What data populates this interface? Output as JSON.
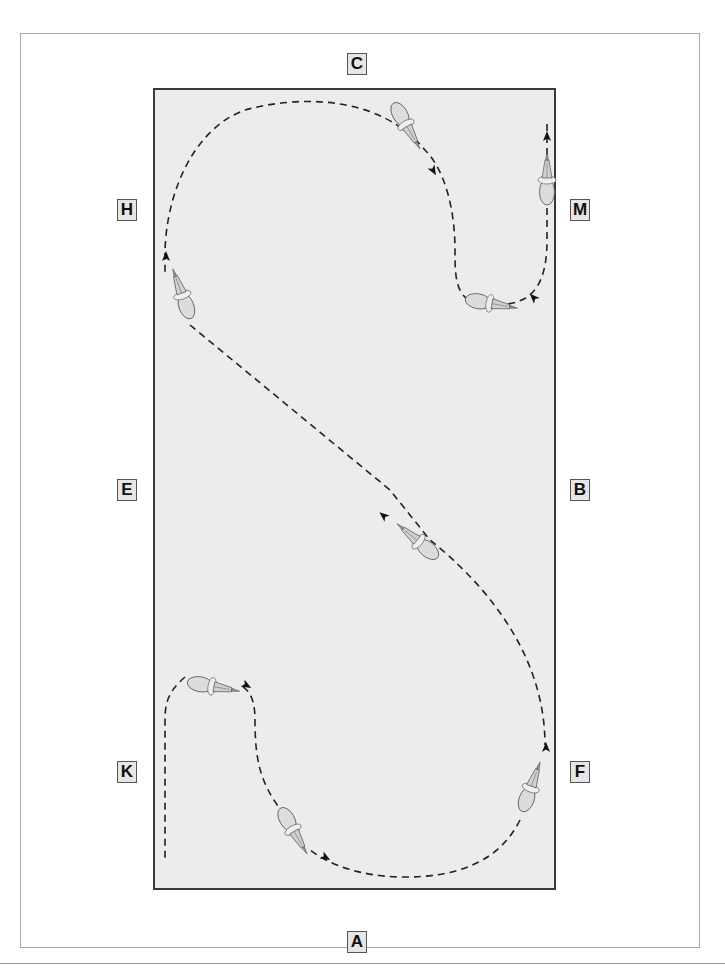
{
  "diagram": {
    "type": "dressage-arena-figure",
    "arena": {
      "fill": "#ececec",
      "border": "#3a3a3a"
    },
    "markers": [
      {
        "id": "C",
        "label": "C",
        "side": "top",
        "x": 347,
        "y": 53
      },
      {
        "id": "H",
        "label": "H",
        "side": "left",
        "x": 117,
        "y": 199
      },
      {
        "id": "M",
        "label": "M",
        "side": "right",
        "x": 570,
        "y": 199
      },
      {
        "id": "E",
        "label": "E",
        "side": "left",
        "x": 117,
        "y": 479
      },
      {
        "id": "B",
        "label": "B",
        "side": "right",
        "x": 570,
        "y": 479
      },
      {
        "id": "K",
        "label": "K",
        "side": "left",
        "x": 117,
        "y": 761
      },
      {
        "id": "F",
        "label": "F",
        "side": "right",
        "x": 570,
        "y": 761
      },
      {
        "id": "A",
        "label": "A",
        "side": "bottom",
        "x": 347,
        "y": 931
      }
    ],
    "path": {
      "style": "dashed",
      "color": "#222222",
      "description": "Serpentine route: up the M track, loop through C to H, diagonal across through X toward F, then curve through A and finish up the K track"
    },
    "horses": [
      {
        "id": "horse-1",
        "x": 547,
        "y": 180,
        "rotation": 0
      },
      {
        "id": "horse-2",
        "x": 488,
        "y": 302,
        "rotation": 100
      },
      {
        "id": "horse-3",
        "x": 408,
        "y": 125,
        "rotation": 150
      },
      {
        "id": "horse-4",
        "x": 180,
        "y": 295,
        "rotation": 160
      },
      {
        "id": "horse-5",
        "x": 425,
        "y": 548,
        "rotation": 140
      },
      {
        "id": "horse-6",
        "x": 535,
        "y": 790,
        "rotation": 20
      },
      {
        "id": "horse-7",
        "x": 298,
        "y": 833,
        "rotation": 160
      },
      {
        "id": "horse-8",
        "x": 210,
        "y": 686,
        "rotation": 100
      }
    ]
  }
}
